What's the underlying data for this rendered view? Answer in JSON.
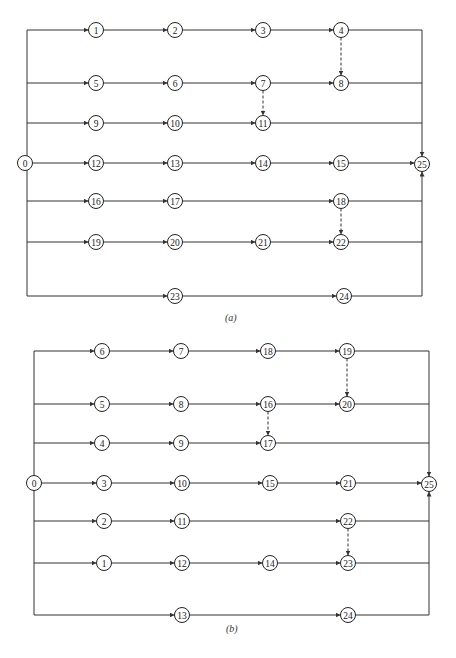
{
  "diagrams": [
    {
      "id": "a",
      "caption": "(a)",
      "caption_pos": [
        233,
        319
      ],
      "left_x": 27,
      "right_x": 422,
      "source": {
        "label": "0",
        "x": 25,
        "y": 163
      },
      "sink": {
        "label": "25",
        "x": 422,
        "y": 164
      },
      "rows": [
        {
          "y": 30,
          "nodes": [
            {
              "label": "1",
              "x": 96
            },
            {
              "label": "2",
              "x": 175
            },
            {
              "label": "3",
              "x": 263
            },
            {
              "label": "4",
              "x": 341
            }
          ]
        },
        {
          "y": 83,
          "nodes": [
            {
              "label": "5",
              "x": 96
            },
            {
              "label": "6",
              "x": 175
            },
            {
              "label": "7",
              "x": 263
            },
            {
              "label": "8",
              "x": 341
            }
          ]
        },
        {
          "y": 123,
          "nodes": [
            {
              "label": "9",
              "x": 96
            },
            {
              "label": "10",
              "x": 175
            },
            {
              "label": "11",
              "x": 263
            }
          ]
        },
        {
          "y": 163,
          "nodes": [
            {
              "label": "12",
              "x": 96
            },
            {
              "label": "13",
              "x": 175
            },
            {
              "label": "14",
              "x": 263
            },
            {
              "label": "15",
              "x": 341
            }
          ],
          "to_sink": true
        },
        {
          "y": 201,
          "nodes": [
            {
              "label": "16",
              "x": 96
            },
            {
              "label": "17",
              "x": 175
            },
            {
              "label": "18",
              "x": 341
            }
          ]
        },
        {
          "y": 242,
          "nodes": [
            {
              "label": "19",
              "x": 96
            },
            {
              "label": "20",
              "x": 175
            },
            {
              "label": "21",
              "x": 263
            },
            {
              "label": "22",
              "x": 341
            }
          ]
        },
        {
          "y": 296,
          "nodes": [
            {
              "label": "23",
              "x": 175
            },
            {
              "label": "24",
              "x": 344
            }
          ]
        }
      ],
      "dummies": [
        {
          "from": "4",
          "to": "8"
        },
        {
          "from": "7",
          "to": "11"
        },
        {
          "from": "18",
          "to": "22"
        }
      ]
    },
    {
      "id": "b",
      "caption": "(b)",
      "caption_pos": [
        234,
        630
      ],
      "left_x": 34,
      "right_x": 429,
      "source": {
        "label": "0",
        "x": 34,
        "y": 483
      },
      "sink": {
        "label": "25",
        "x": 429,
        "y": 484
      },
      "rows": [
        {
          "y": 351,
          "nodes": [
            {
              "label": "6",
              "x": 102
            },
            {
              "label": "7",
              "x": 181
            },
            {
              "label": "18",
              "x": 268
            },
            {
              "label": "19",
              "x": 347
            }
          ]
        },
        {
          "y": 404,
          "nodes": [
            {
              "label": "5",
              "x": 102
            },
            {
              "label": "8",
              "x": 181
            },
            {
              "label": "16",
              "x": 268
            },
            {
              "label": "20",
              "x": 347
            }
          ]
        },
        {
          "y": 443,
          "nodes": [
            {
              "label": "4",
              "x": 102
            },
            {
              "label": "9",
              "x": 181
            },
            {
              "label": "17",
              "x": 268
            }
          ]
        },
        {
          "y": 483,
          "nodes": [
            {
              "label": "3",
              "x": 104
            },
            {
              "label": "10",
              "x": 182
            },
            {
              "label": "15",
              "x": 270
            },
            {
              "label": "21",
              "x": 348
            }
          ],
          "to_sink": true
        },
        {
          "y": 521,
          "nodes": [
            {
              "label": "2",
              "x": 104
            },
            {
              "label": "11",
              "x": 182
            },
            {
              "label": "22",
              "x": 348
            }
          ]
        },
        {
          "y": 563,
          "nodes": [
            {
              "label": "1",
              "x": 104
            },
            {
              "label": "12",
              "x": 182
            },
            {
              "label": "14",
              "x": 270
            },
            {
              "label": "23",
              "x": 348
            }
          ]
        },
        {
          "y": 615,
          "nodes": [
            {
              "label": "13",
              "x": 182
            },
            {
              "label": "24",
              "x": 348
            }
          ]
        }
      ],
      "dummies": [
        {
          "from": "19",
          "to": "20"
        },
        {
          "from": "16",
          "to": "17"
        },
        {
          "from": "22",
          "to": "23"
        }
      ]
    }
  ],
  "style": {
    "node_radius": 7.5,
    "stroke": "#333333"
  }
}
